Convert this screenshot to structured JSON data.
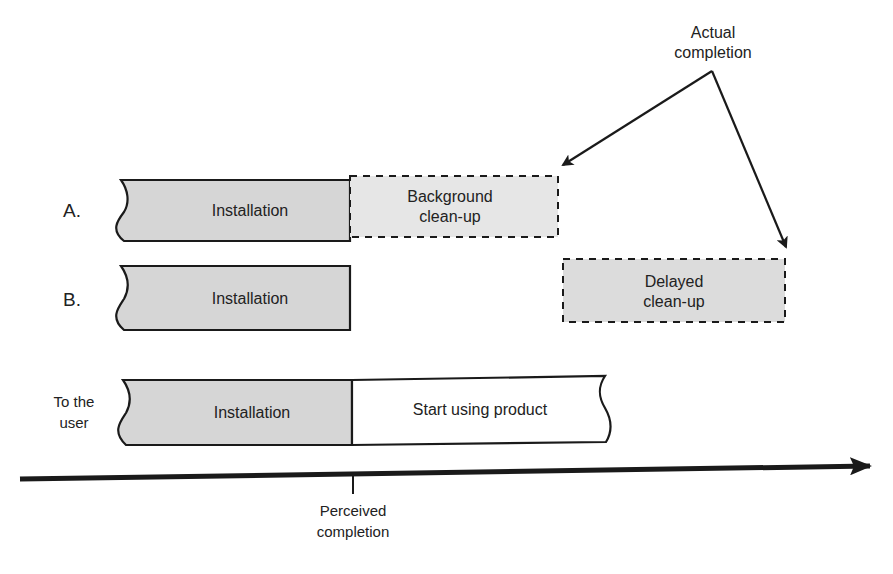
{
  "diagram": {
    "type": "timeline",
    "annotations": {
      "actual_completion": "Actual completion",
      "actual_completion_line1": "Actual",
      "actual_completion_line2": "completion",
      "perceived_completion_line1": "Perceived",
      "perceived_completion_line2": "completion"
    },
    "rows": [
      {
        "label": "A.",
        "segments": [
          {
            "text": "Installation",
            "style": "solid",
            "fill": "#d6d6d6"
          },
          {
            "text_line1": "Background",
            "text_line2": "clean-up",
            "style": "dashed",
            "fill": "#e6e6e6"
          }
        ]
      },
      {
        "label": "B.",
        "segments": [
          {
            "text": "Installation",
            "style": "solid",
            "fill": "#d6d6d6"
          },
          {
            "text_line1": "Delayed",
            "text_line2": "clean-up",
            "style": "dashed",
            "fill": "#dcdcdc"
          }
        ]
      },
      {
        "label_line1": "To the",
        "label_line2": "user",
        "segments": [
          {
            "text": "Installation",
            "style": "solid",
            "fill": "#d6d6d6"
          },
          {
            "text": "Start using product",
            "style": "solid",
            "fill": "#ffffff"
          }
        ]
      }
    ],
    "colors": {
      "stroke": "#1a1a1a",
      "installation_fill": "#d6d6d6",
      "cleanup_fill": "#e6e6e6",
      "delayed_fill": "#dcdcdc",
      "usage_fill": "#ffffff"
    }
  }
}
